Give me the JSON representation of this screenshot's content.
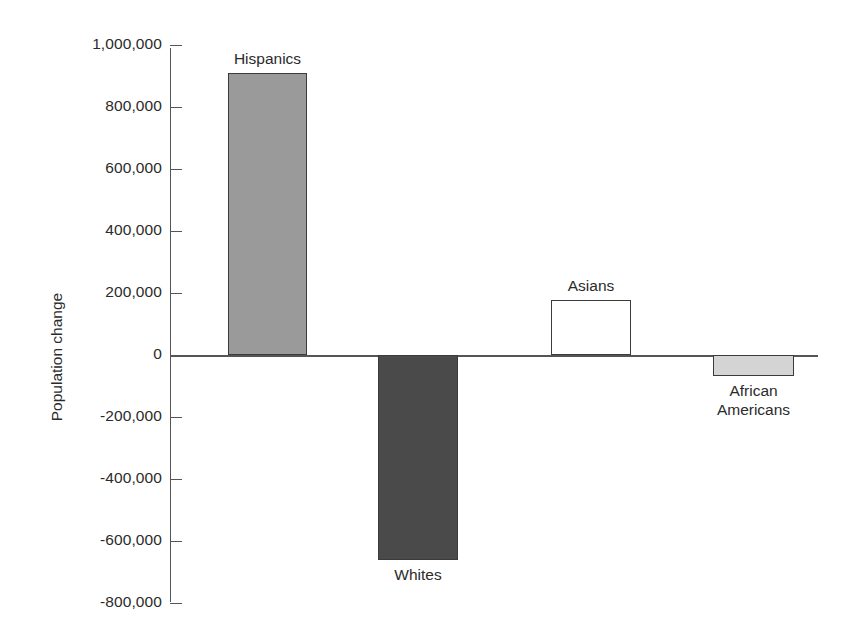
{
  "chart_data": {
    "type": "bar",
    "title": "",
    "xlabel": "",
    "ylabel": "Population change",
    "categories": [
      "Hispanics",
      "Whites",
      "Asians",
      "African Americans"
    ],
    "values": [
      910000,
      -660000,
      178000,
      -68000
    ],
    "ylim": [
      -800000,
      1000000
    ],
    "ytick_values": [
      1000000,
      800000,
      600000,
      400000,
      200000,
      0,
      -200000,
      -400000,
      -600000,
      -800000
    ],
    "ytick_labels": [
      "1,000,000",
      "800,000",
      "600,000",
      "400,000",
      "200,000",
      "0",
      "-200,000",
      "-400,000",
      "-600,000",
      "-800,000"
    ],
    "grid": false,
    "legend": "none",
    "bars": [
      {
        "category": "Hispanics",
        "label": "Hispanics",
        "value": 910000,
        "fill": "#9a9a9a",
        "stroke": "#3b3b3b",
        "label_position": "above"
      },
      {
        "category": "Whites",
        "label": "Whites",
        "value": -660000,
        "fill": "#4a4a4a",
        "stroke": "#3b3b3b",
        "label_position": "below"
      },
      {
        "category": "Asians",
        "label": "Asians",
        "value": 178000,
        "fill": "#ffffff",
        "stroke": "#3b3b3b",
        "label_position": "above"
      },
      {
        "category": "African Americans",
        "label": "African Americans",
        "label_line1": "African",
        "label_line2": "Americans",
        "value": -68000,
        "fill": "#d4d4d4",
        "stroke": "#3b3b3b",
        "label_position": "below"
      }
    ]
  },
  "axis": {
    "zero_label": "0",
    "title": "Population change"
  }
}
